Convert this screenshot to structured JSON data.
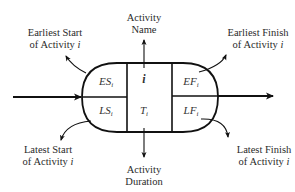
{
  "diagram": {
    "type": "activity-on-node",
    "node": {
      "activity_name_symbol": "i",
      "cells": {
        "earliest_start": {
          "base": "ES",
          "sub": "i"
        },
        "earliest_finish": {
          "base": "EF",
          "sub": "i"
        },
        "latest_start": {
          "base": "LS",
          "sub": "i"
        },
        "latest_finish": {
          "base": "LF",
          "sub": "i"
        },
        "duration": {
          "base": "T",
          "sub": "i"
        }
      }
    },
    "labels": {
      "activity_name": {
        "line1": "Activity",
        "line2": "Name"
      },
      "activity_duration": {
        "line1": "Activity",
        "line2": "Duration"
      },
      "earliest_start": {
        "line1": "Earliest Start",
        "line2": "of Activity ",
        "var": "i"
      },
      "earliest_finish": {
        "line1": "Earliest Finish",
        "line2": "of Activity ",
        "var": "i"
      },
      "latest_start": {
        "line1": "Latest Start",
        "line2": "of Activity ",
        "var": "i"
      },
      "latest_finish": {
        "line1": "Latest Finish",
        "line2": "of Activity ",
        "var": "i"
      }
    },
    "colors": {
      "line": "#111111",
      "text": "#2a2a2a",
      "background": "#ffffff"
    }
  }
}
